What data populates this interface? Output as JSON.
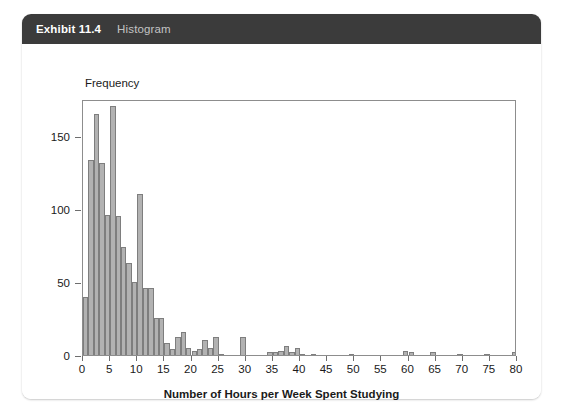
{
  "exhibit": {
    "number": "Exhibit 11.4",
    "title": "Histogram"
  },
  "chart_data": {
    "type": "bar",
    "title": "Histogram",
    "xlabel": "Number of Hours per Week Spent Studying",
    "ylabel": "Frequency",
    "xlim": [
      0,
      80
    ],
    "ylim": [
      0,
      175
    ],
    "xticks": [
      0,
      5,
      10,
      15,
      20,
      25,
      30,
      35,
      40,
      45,
      50,
      55,
      60,
      65,
      70,
      75,
      80
    ],
    "yticks": [
      0,
      50,
      100,
      150
    ],
    "grid": false,
    "legend": false,
    "bin_width": 1,
    "bar_fill": "#b2b2b2",
    "bar_stroke": "#7e7e7e",
    "bin_starts": [
      0,
      1,
      2,
      3,
      4,
      5,
      6,
      7,
      8,
      9,
      10,
      11,
      12,
      13,
      14,
      15,
      16,
      17,
      18,
      19,
      20,
      21,
      22,
      23,
      24,
      25,
      26,
      27,
      28,
      29,
      30,
      31,
      32,
      33,
      34,
      35,
      36,
      37,
      38,
      39,
      40,
      41,
      42,
      43,
      44,
      45,
      46,
      47,
      48,
      49,
      50,
      51,
      52,
      53,
      54,
      55,
      56,
      57,
      58,
      59,
      60,
      61,
      62,
      63,
      64,
      65,
      66,
      67,
      68,
      69,
      70,
      71,
      72,
      73,
      74,
      75,
      76,
      77,
      78,
      79
    ],
    "values": [
      40,
      133,
      165,
      131,
      96,
      170,
      95,
      74,
      63,
      50,
      110,
      46,
      46,
      25,
      25,
      8,
      4,
      12,
      16,
      5,
      3,
      4,
      10,
      5,
      12,
      1,
      0,
      0,
      0,
      12,
      0,
      0,
      0,
      0,
      2,
      2,
      3,
      6,
      2,
      5,
      1,
      0,
      1,
      0,
      0,
      0,
      0,
      0,
      0,
      1,
      0,
      0,
      0,
      0,
      0,
      0,
      0,
      0,
      0,
      3,
      2,
      0,
      0,
      0,
      2,
      0,
      0,
      0,
      0,
      1,
      0,
      0,
      0,
      0,
      1,
      0,
      0,
      0,
      0,
      2
    ]
  }
}
